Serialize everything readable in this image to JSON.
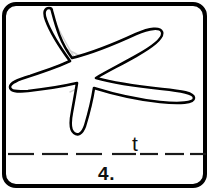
{
  "card": {
    "item_number": "4.",
    "written_letter": "t",
    "border_color": "#000000",
    "background_color": "#ffffff",
    "line_color": "#1a1a1a",
    "illustration_name": "starfish",
    "illustration_outline_color": "#000000",
    "illustration_inner_detail_color": "#cfcfcf"
  },
  "writing_line": {
    "style": "dashed",
    "dash_count": 7,
    "color": "#1a1a1a"
  }
}
